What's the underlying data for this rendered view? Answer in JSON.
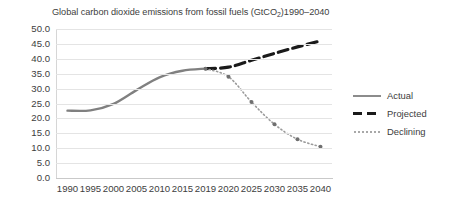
{
  "chart_data": {
    "type": "line",
    "title": "Global carbon dioxide emissions from fossil fuels (GtCO2)1990–2040",
    "title_main": "Global carbon dioxide emissions from fossil fuels (GtCO",
    "title_sub": "2",
    "title_tail": ")1990–2040",
    "xlabel": "",
    "ylabel": "",
    "ylim": [
      0,
      50
    ],
    "yticks": [
      "0.0",
      "5.0",
      "10.0",
      "15.0",
      "20.0",
      "25.0",
      "30.0",
      "35.0",
      "40.0",
      "45.0",
      "50.0"
    ],
    "xticks": [
      "1990",
      "1995",
      "2000",
      "2005",
      "2010",
      "2015",
      "2019",
      "2020",
      "2025",
      "2030",
      "2035",
      "2040"
    ],
    "grid": true,
    "legend_position": "right",
    "series": [
      {
        "name": "Actual",
        "style": "solid",
        "color": "#808080",
        "x": [
          1990,
          1995,
          2000,
          2005,
          2010,
          2015,
          2019
        ],
        "values": [
          22.6,
          22.7,
          24.9,
          29.5,
          33.8,
          36.0,
          36.7
        ]
      },
      {
        "name": "Projected",
        "style": "dashed",
        "color": "#1a1a1a",
        "x": [
          2019,
          2020,
          2025,
          2030,
          2035,
          2040
        ],
        "values": [
          36.7,
          37.2,
          39.5,
          41.8,
          44.0,
          46.0
        ]
      },
      {
        "name": "Declining",
        "style": "dotted",
        "color": "#9a9a9a",
        "x": [
          2019,
          2020,
          2025,
          2030,
          2035,
          2040
        ],
        "values": [
          36.7,
          34.0,
          25.5,
          18.0,
          13.0,
          10.5
        ]
      }
    ]
  },
  "legend": {
    "items": [
      {
        "label": "Actual",
        "swatch": "solid-line-swatch"
      },
      {
        "label": "Projected",
        "swatch": "dashed-line-swatch"
      },
      {
        "label": "Declining",
        "swatch": "dotted-line-swatch"
      }
    ]
  }
}
